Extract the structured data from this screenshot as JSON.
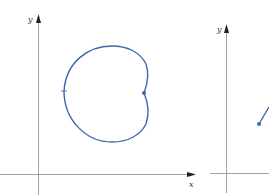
{
  "figure": {
    "left_panel": {
      "axis_labels": {
        "x": "x",
        "y": "y"
      },
      "curve": {
        "shape": "cardioid",
        "color": "#3f67ad"
      },
      "markers": [
        "start-point-dot",
        "direction-tick"
      ]
    },
    "right_panel": {
      "axis_labels": {
        "y": "y"
      },
      "curve": {
        "shape": "line-segment",
        "color": "#3f67ad"
      },
      "markers": [
        "start-point-dot"
      ]
    },
    "colors": {
      "axis": "#8a8a8a",
      "curve": "#3f67ad",
      "background": "#ffffff"
    }
  }
}
